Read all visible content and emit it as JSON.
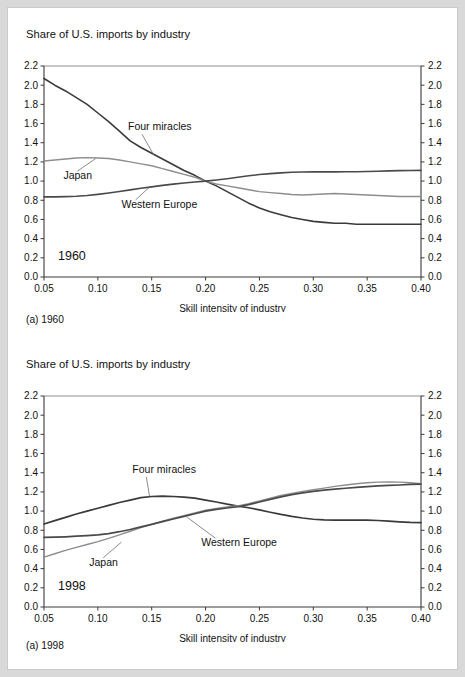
{
  "figure": {
    "background_color": "#d9d9d9",
    "sheet_color": "#ffffff"
  },
  "panels": [
    {
      "id": "a",
      "title": "Share of U.S. imports by industry",
      "caption": "(a) 1960",
      "year_label": "1960",
      "xlabel": "Skill intensity of industry",
      "series_labels": {
        "four_miracles": "Four miracles",
        "japan": "Japan",
        "western_europe": "Western Europe"
      }
    },
    {
      "id": "b",
      "title": "Share of U.S. imports by industry",
      "caption": "(a) 1998",
      "year_label": "1998",
      "xlabel": "Skill intensity of industry",
      "series_labels": {
        "four_miracles": "Four miracles",
        "japan": "Japan",
        "western_europe": "Western Europe"
      }
    }
  ],
  "chart_data": [
    {
      "type": "line",
      "id": "chart-1960",
      "title": "Share of U.S. imports by industry",
      "caption": "(a) 1960",
      "annotation": "1960",
      "xlabel": "Skill intensity of industry",
      "ylabel": "",
      "xlim": [
        0.05,
        0.4
      ],
      "ylim": [
        0.0,
        2.2
      ],
      "xticks": [
        0.05,
        0.1,
        0.15,
        0.2,
        0.25,
        0.3,
        0.35,
        0.4
      ],
      "xticklabels": [
        "0.05",
        "0.10",
        "0.15",
        "0.20",
        "0.25",
        "0.30",
        "0.35",
        "0.40"
      ],
      "yticks": [
        0.0,
        0.2,
        0.4,
        0.6,
        0.8,
        1.0,
        1.2,
        1.4,
        1.6,
        1.8,
        2.0,
        2.2
      ],
      "yticklabels": [
        "0.0",
        "0.2",
        "0.4",
        "0.6",
        "0.8",
        "1.0",
        "1.2",
        "1.4",
        "1.6",
        "1.8",
        "2.0",
        "2.2"
      ],
      "right_axis_mirror": true,
      "grid": false,
      "legend": "inline-labels",
      "x": [
        0.05,
        0.06,
        0.07,
        0.08,
        0.09,
        0.1,
        0.11,
        0.12,
        0.13,
        0.14,
        0.15,
        0.16,
        0.17,
        0.18,
        0.19,
        0.2,
        0.21,
        0.22,
        0.23,
        0.24,
        0.25,
        0.26,
        0.27,
        0.28,
        0.29,
        0.3,
        0.31,
        0.32,
        0.33,
        0.34,
        0.35,
        0.36,
        0.37,
        0.38,
        0.39,
        0.4
      ],
      "series": [
        {
          "name": "Four miracles",
          "color": "#3a3a3a",
          "width": 1.6,
          "values": [
            2.07,
            2.0,
            1.94,
            1.87,
            1.8,
            1.71,
            1.62,
            1.52,
            1.42,
            1.35,
            1.29,
            1.23,
            1.17,
            1.11,
            1.06,
            1.0,
            0.95,
            0.89,
            0.83,
            0.77,
            0.72,
            0.68,
            0.65,
            0.62,
            0.6,
            0.58,
            0.57,
            0.56,
            0.56,
            0.55,
            0.55,
            0.55,
            0.55,
            0.55,
            0.55,
            0.55
          ]
        },
        {
          "name": "Japan",
          "color": "#8d8d8d",
          "width": 1.4,
          "values": [
            1.21,
            1.22,
            1.23,
            1.24,
            1.245,
            1.24,
            1.235,
            1.22,
            1.2,
            1.18,
            1.16,
            1.13,
            1.1,
            1.07,
            1.04,
            1.0,
            0.97,
            0.95,
            0.93,
            0.91,
            0.89,
            0.88,
            0.87,
            0.86,
            0.855,
            0.86,
            0.865,
            0.87,
            0.865,
            0.86,
            0.855,
            0.85,
            0.845,
            0.84,
            0.84,
            0.84
          ]
        },
        {
          "name": "Western Europe",
          "color": "#4a4a4a",
          "width": 1.6,
          "values": [
            0.835,
            0.835,
            0.838,
            0.842,
            0.85,
            0.862,
            0.876,
            0.892,
            0.908,
            0.925,
            0.94,
            0.955,
            0.968,
            0.98,
            0.99,
            1.0,
            1.012,
            1.025,
            1.04,
            1.055,
            1.068,
            1.078,
            1.086,
            1.092,
            1.095,
            1.096,
            1.096,
            1.096,
            1.097,
            1.098,
            1.1,
            1.103,
            1.106,
            1.109,
            1.111,
            1.112
          ]
        }
      ],
      "label_anchors": [
        {
          "series": "Four miracles",
          "text_x": 0.128,
          "text_y": 1.53,
          "point_x": 0.152,
          "point_y": 1.27
        },
        {
          "series": "Japan",
          "text_x": 0.068,
          "text_y": 1.02,
          "point_x": 0.098,
          "point_y": 1.235
        },
        {
          "series": "Western Europe",
          "text_x": 0.122,
          "text_y": 0.72,
          "point_x": 0.148,
          "point_y": 0.938
        }
      ]
    },
    {
      "type": "line",
      "id": "chart-1998",
      "title": "Share of U.S. imports by industry",
      "caption": "(a) 1998",
      "annotation": "1998",
      "xlabel": "Skill intensity of industry",
      "ylabel": "",
      "xlim": [
        0.05,
        0.4
      ],
      "ylim": [
        0.0,
        2.2
      ],
      "xticks": [
        0.05,
        0.1,
        0.15,
        0.2,
        0.25,
        0.3,
        0.35,
        0.4
      ],
      "xticklabels": [
        "0.05",
        "0.10",
        "0.15",
        "0.20",
        "0.25",
        "0.30",
        "0.35",
        "0.40"
      ],
      "yticks": [
        0.0,
        0.2,
        0.4,
        0.6,
        0.8,
        1.0,
        1.2,
        1.4,
        1.6,
        1.8,
        2.0,
        2.2
      ],
      "yticklabels": [
        "0.0",
        "0.2",
        "0.4",
        "0.6",
        "0.8",
        "1.0",
        "1.2",
        "1.4",
        "1.6",
        "1.8",
        "2.0",
        "2.2"
      ],
      "right_axis_mirror": true,
      "grid": false,
      "legend": "inline-labels",
      "x": [
        0.05,
        0.06,
        0.07,
        0.08,
        0.09,
        0.1,
        0.11,
        0.12,
        0.13,
        0.14,
        0.15,
        0.16,
        0.17,
        0.18,
        0.19,
        0.2,
        0.21,
        0.22,
        0.23,
        0.24,
        0.25,
        0.26,
        0.27,
        0.28,
        0.29,
        0.3,
        0.31,
        0.32,
        0.33,
        0.34,
        0.35,
        0.36,
        0.37,
        0.38,
        0.39,
        0.4
      ],
      "series": [
        {
          "name": "Four miracles",
          "color": "#3a3a3a",
          "width": 1.7,
          "values": [
            0.865,
            0.9,
            0.935,
            0.97,
            1.0,
            1.03,
            1.06,
            1.09,
            1.115,
            1.14,
            1.152,
            1.155,
            1.152,
            1.145,
            1.135,
            1.115,
            1.095,
            1.072,
            1.052,
            1.035,
            1.012,
            0.988,
            0.965,
            0.945,
            0.928,
            0.915,
            0.908,
            0.905,
            0.905,
            0.905,
            0.905,
            0.902,
            0.895,
            0.888,
            0.882,
            0.88
          ]
        },
        {
          "name": "Japan",
          "color": "#8d8d8d",
          "width": 1.4,
          "values": [
            0.52,
            0.555,
            0.59,
            0.622,
            0.652,
            0.682,
            0.715,
            0.752,
            0.79,
            0.828,
            0.862,
            0.895,
            0.925,
            0.952,
            0.982,
            1.01,
            1.028,
            1.042,
            1.055,
            1.078,
            1.105,
            1.135,
            1.162,
            1.185,
            1.205,
            1.222,
            1.24,
            1.258,
            1.272,
            1.285,
            1.295,
            1.302,
            1.305,
            1.302,
            1.295,
            1.285
          ]
        },
        {
          "name": "Western Europe",
          "color": "#4a4a4a",
          "width": 1.7,
          "values": [
            0.725,
            0.728,
            0.732,
            0.738,
            0.745,
            0.752,
            0.765,
            0.785,
            0.808,
            0.835,
            0.862,
            0.89,
            0.918,
            0.945,
            0.972,
            1.0,
            1.018,
            1.032,
            1.045,
            1.068,
            1.095,
            1.122,
            1.148,
            1.172,
            1.19,
            1.205,
            1.218,
            1.228,
            1.238,
            1.248,
            1.255,
            1.262,
            1.268,
            1.272,
            1.278,
            1.282
          ]
        }
      ],
      "label_anchors": [
        {
          "series": "Four miracles",
          "text_x": 0.132,
          "text_y": 1.4,
          "point_x": 0.148,
          "point_y": 1.152
        },
        {
          "series": "Japan",
          "text_x": 0.092,
          "text_y": 0.43,
          "point_x": 0.122,
          "point_y": 0.678
        },
        {
          "series": "Western Europe",
          "text_x": 0.196,
          "text_y": 0.635,
          "point_x": 0.183,
          "point_y": 0.935
        }
      ]
    }
  ]
}
